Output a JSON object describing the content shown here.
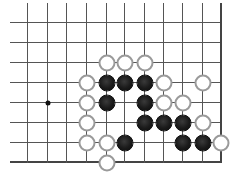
{
  "diagram": {
    "type": "go-board-fragment",
    "grid": {
      "columns_x": [
        27,
        47,
        66,
        86,
        106,
        124,
        144,
        163,
        182,
        202,
        220
      ],
      "rows_y": [
        22,
        42,
        62,
        82,
        102,
        122,
        142,
        162
      ],
      "h_line_start_x": 10,
      "v_line_start_y": 3,
      "right_edge_col": 10,
      "bottom_edge_row": 7
    },
    "star_points": [
      [
        1,
        4
      ]
    ],
    "stones": {
      "white": [
        [
          4,
          2
        ],
        [
          5,
          2
        ],
        [
          6,
          2
        ],
        [
          3,
          3
        ],
        [
          7,
          3
        ],
        [
          9,
          3
        ],
        [
          3,
          4
        ],
        [
          7,
          4
        ],
        [
          8,
          4
        ],
        [
          3,
          5
        ],
        [
          9,
          5
        ],
        [
          3,
          6
        ],
        [
          4,
          6
        ],
        [
          10,
          6
        ],
        [
          4,
          7
        ]
      ],
      "black": [
        [
          4,
          3
        ],
        [
          5,
          3
        ],
        [
          6,
          3
        ],
        [
          4,
          4
        ],
        [
          6,
          4
        ],
        [
          6,
          5
        ],
        [
          7,
          5
        ],
        [
          8,
          5
        ],
        [
          5,
          6
        ],
        [
          8,
          6
        ],
        [
          9,
          6
        ]
      ]
    },
    "colors": {
      "line": "#555555",
      "black_stone": "#1a1a1a",
      "white_stone_border": "#9a9a9a",
      "background": "#ffffff"
    }
  }
}
